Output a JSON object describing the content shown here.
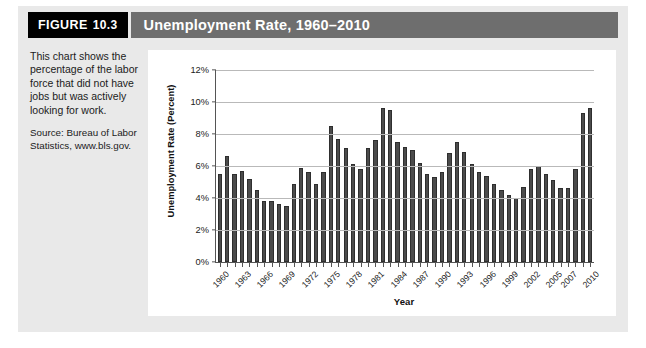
{
  "figure": {
    "badge_label": "FIGURE",
    "badge_number": "10.3",
    "title": "Unemployment Rate, 1960–2010",
    "caption_body": "This chart shows the percentage of the labor force that did not have jobs but was actively looking for work.",
    "caption_source": "Source: Bureau of Labor Statistics, www.bls.gov."
  },
  "colors": {
    "badge_bg": "#000000",
    "titlebar_bg": "#6e6e6e",
    "figure_bg": "#e9e9e9",
    "panel_bg": "#ffffff",
    "bar_fill": "#4b4b4b",
    "gridline": "#b9b9b9",
    "axis": "#555555"
  },
  "chart_data": {
    "type": "bar",
    "title": "Unemployment Rate, 1960–2010",
    "xlabel": "Year",
    "ylabel": "Unemployment Rate (Percent)",
    "ylim": [
      0,
      12
    ],
    "ytick_values": [
      0,
      2,
      4,
      6,
      8,
      10,
      12
    ],
    "ytick_labels": [
      "0%",
      "2%",
      "4%",
      "6%",
      "8%",
      "10%",
      "12%"
    ],
    "grid": "horizontal",
    "legend": "none",
    "xtick_labels": [
      "1960",
      "1963",
      "1966",
      "1969",
      "1972",
      "1975",
      "1978",
      "1981",
      "1984",
      "1987",
      "1990",
      "1993",
      "1996",
      "1999",
      "2002",
      "2005",
      "2007",
      "2010"
    ],
    "xtick_indices": [
      0,
      3,
      6,
      9,
      12,
      15,
      18,
      21,
      24,
      27,
      30,
      33,
      36,
      39,
      42,
      45,
      47,
      50
    ],
    "categories": [
      "1960",
      "1961",
      "1962",
      "1963",
      "1964",
      "1965",
      "1966",
      "1967",
      "1968",
      "1969",
      "1970",
      "1971",
      "1972",
      "1973",
      "1974",
      "1975",
      "1976",
      "1977",
      "1978",
      "1979",
      "1980",
      "1981",
      "1982",
      "1983",
      "1984",
      "1985",
      "1986",
      "1987",
      "1988",
      "1989",
      "1990",
      "1991",
      "1992",
      "1993",
      "1994",
      "1995",
      "1996",
      "1997",
      "1998",
      "1999",
      "2000",
      "2001",
      "2002",
      "2003",
      "2004",
      "2005",
      "2006",
      "2007",
      "2008",
      "2009",
      "2010"
    ],
    "values": [
      5.5,
      6.6,
      5.5,
      5.7,
      5.2,
      4.5,
      3.8,
      3.8,
      3.6,
      3.5,
      4.9,
      5.9,
      5.6,
      4.9,
      5.6,
      8.5,
      7.7,
      7.1,
      6.1,
      5.8,
      7.1,
      7.6,
      9.6,
      9.5,
      7.5,
      7.2,
      7.0,
      6.2,
      5.5,
      5.3,
      5.6,
      6.8,
      7.5,
      6.9,
      6.1,
      5.6,
      5.4,
      4.9,
      4.5,
      4.2,
      4.0,
      4.7,
      5.8,
      6.0,
      5.5,
      5.1,
      4.6,
      4.6,
      5.8,
      9.3,
      9.6
    ]
  }
}
